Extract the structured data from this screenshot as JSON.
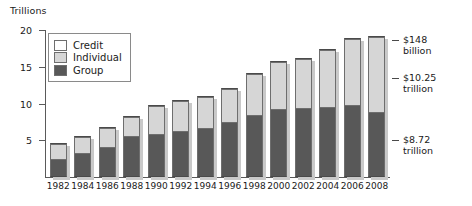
{
  "chart_data": {
    "type": "bar",
    "subtype": "stacked-bar",
    "title": "",
    "xlabel": "",
    "ylabel": "Trillions",
    "ylim": [
      0,
      20
    ],
    "yticks": [
      5,
      10,
      15,
      20
    ],
    "grid": false,
    "legend_position": "top-left",
    "categories": [
      "1982",
      "1984",
      "1986",
      "1988",
      "1990",
      "1992",
      "1994",
      "1996",
      "1998",
      "2000",
      "2002",
      "2004",
      "2006",
      "2008"
    ],
    "series": [
      {
        "name": "Group",
        "color": "#585858",
        "values": [
          2.3,
          3.1,
          4.0,
          5.4,
          5.7,
          6.1,
          6.6,
          7.4,
          8.3,
          9.1,
          9.2,
          9.4,
          9.7,
          8.72
        ]
      },
      {
        "name": "Individual",
        "color": "#d6d6d6",
        "values": [
          2.0,
          2.2,
          2.5,
          2.6,
          3.8,
          4.1,
          4.2,
          4.5,
          5.6,
          6.4,
          6.7,
          7.8,
          9.0,
          10.25
        ]
      },
      {
        "name": "Credit",
        "color": "#ffffff",
        "values": [
          0.15,
          0.15,
          0.2,
          0.2,
          0.2,
          0.2,
          0.2,
          0.2,
          0.25,
          0.25,
          0.25,
          0.25,
          0.25,
          0.148
        ]
      }
    ],
    "totals": [
      4.45,
      5.45,
      6.7,
      8.2,
      9.7,
      10.4,
      11.0,
      12.1,
      14.15,
      15.75,
      16.15,
      17.45,
      18.95,
      19.118
    ],
    "annotations": [
      {
        "label_line1": "$148",
        "label_line2": "billion",
        "series": "Credit",
        "year": "2008"
      },
      {
        "label_line1": "$10.25",
        "label_line2": "trillion",
        "series": "Individual",
        "year": "2008"
      },
      {
        "label_line1": "$8.72",
        "label_line2": "trillion",
        "series": "Group",
        "year": "2008"
      }
    ]
  },
  "legend": {
    "items": [
      {
        "label": "Credit",
        "swatch": "credit"
      },
      {
        "label": "Individual",
        "swatch": "individual"
      },
      {
        "label": "Group",
        "swatch": "group"
      }
    ]
  },
  "axis": {
    "unit_label": "Trillions",
    "y_tick_labels": [
      "20",
      "15",
      "10",
      "5"
    ],
    "x_tick_labels": [
      "1982",
      "1984",
      "1986",
      "1988",
      "1990",
      "1992",
      "1994",
      "1996",
      "1998",
      "2000",
      "2002",
      "2004",
      "2006",
      "2008"
    ]
  }
}
